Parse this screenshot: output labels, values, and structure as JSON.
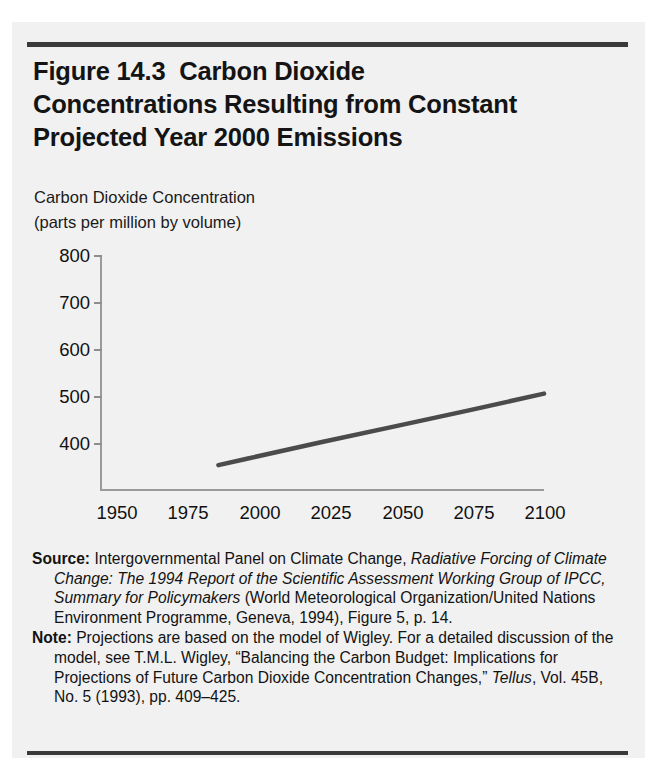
{
  "figure": {
    "title_lines": [
      "Figure 14.3  Carbon Dioxide",
      "Concentrations Resulting from Constant",
      "Projected Year 2000 Emissions"
    ],
    "axis_caption_lines": [
      "Carbon Dioxide Concentration",
      "(parts per million by volume)"
    ],
    "source_label": "Source:",
    "source_segments": [
      {
        "text": "Intergovernmental Panel on Climate Change, ",
        "style": "roman"
      },
      {
        "text": "Radiative Forcing of Climate Change: The 1994 Report of the Scientific Assessment Working Group of IPCC, Summary for Policymakers",
        "style": "italic"
      },
      {
        "text": " (World Meteorological Organization/United Nations Environment Programme, Geneva, 1994), Figure 5, p. 14.",
        "style": "roman"
      }
    ],
    "note_label": "Note:",
    "note_segments": [
      {
        "text": "Projections are based on the model of Wigley. For a detailed discussion of the model, see T.M.L. Wigley, “Balancing the Carbon Budget: Implications for Projections of Future Carbon Dioxide Concentration Changes,” ",
        "style": "roman"
      },
      {
        "text": "Tellus",
        "style": "italic"
      },
      {
        "text": ", Vol. 45B, No. 5 (1993), pp. 409–425.",
        "style": "roman"
      }
    ],
    "colors": {
      "rule": "#3a3a3a",
      "background": "#f1f1f1",
      "axis": "#9a9a9a",
      "series_line": "#4b4b4b",
      "text": "#111111"
    }
  },
  "chart_data": {
    "type": "line",
    "title": "Figure 14.3  Carbon Dioxide Concentrations Resulting from Constant Projected Year 2000 Emissions",
    "xlabel": "",
    "ylabel": "Carbon Dioxide Concentration (parts per million by volume)",
    "xlim": [
      1950,
      2100
    ],
    "ylim": [
      300,
      800
    ],
    "xticks": [
      1950,
      1975,
      2000,
      2025,
      2050,
      2075,
      2100
    ],
    "xtick_labels": [
      "1950",
      "1975",
      "2000",
      "2025",
      "2050",
      "2075",
      "2100"
    ],
    "yticks": [
      400,
      500,
      600,
      700,
      800
    ],
    "ytick_labels": [
      "400",
      "500",
      "600",
      "700",
      "800"
    ],
    "grid": false,
    "legend": false,
    "series": [
      {
        "name": "CO2 concentration",
        "color": "#4b4b4b",
        "x": [
          1990,
          2000,
          2025,
          2050,
          2075,
          2100
        ],
        "values": [
          353,
          367,
          402,
          436,
          470,
          505
        ]
      }
    ]
  }
}
